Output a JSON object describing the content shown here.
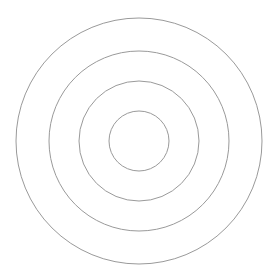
{
  "diagram": {
    "type": "concentric-circles",
    "background": "#ffffff",
    "stroke_color": "#9a9a9a",
    "center": {
      "x": 139,
      "y": 141
    },
    "rings": [
      {
        "name": "outer",
        "radius": 123
      },
      {
        "name": "second",
        "radius": 90
      },
      {
        "name": "third",
        "radius": 60
      },
      {
        "name": "inner",
        "radius": 30
      }
    ]
  }
}
